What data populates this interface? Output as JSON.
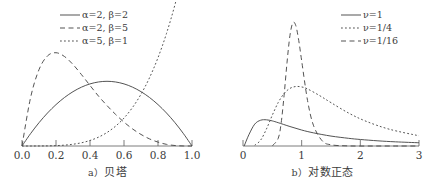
{
  "figure": {
    "background_color": "#ffffff",
    "line_color": "#4a4a4a",
    "axis_color": "#6e6e6e",
    "text_color": "#3c3c3c"
  },
  "panels": [
    {
      "id": "beta",
      "caption_letter": "a）",
      "caption_text": "贝塔",
      "caption_full": "a）贝塔"
    },
    {
      "id": "lognormal",
      "caption_letter": "b）",
      "caption_text": "对数正态",
      "caption_full": "b）对数正态"
    }
  ],
  "chart_data": [
    {
      "type": "line",
      "id": "beta",
      "title": "a）贝塔",
      "xlabel": "",
      "ylabel": "",
      "xlim": [
        0.0,
        1.0
      ],
      "ylim": [
        0.0,
        3.2
      ],
      "grid": false,
      "legend_position": "top-center",
      "xticks": [
        0.0,
        0.2,
        0.4,
        0.6,
        0.8,
        1.0
      ],
      "xticklabels": [
        "0.0",
        "0.2",
        "0.4",
        "0.6",
        "0.8",
        "1.0"
      ],
      "yticks": [],
      "yticklabels": [],
      "series": [
        {
          "name": "α=2, β=2",
          "alpha": 2,
          "beta": 2,
          "linestyle": "solid",
          "x": [
            0.0,
            0.05,
            0.1,
            0.15,
            0.2,
            0.25,
            0.3,
            0.35,
            0.4,
            0.45,
            0.5,
            0.55,
            0.6,
            0.65,
            0.7,
            0.75,
            0.8,
            0.85,
            0.9,
            0.95,
            1.0
          ],
          "values": [
            0.0,
            0.285,
            0.54,
            0.765,
            0.96,
            1.125,
            1.26,
            1.365,
            1.44,
            1.485,
            1.5,
            1.485,
            1.44,
            1.365,
            1.26,
            1.125,
            0.96,
            0.765,
            0.54,
            0.285,
            0.0
          ]
        },
        {
          "name": "α=2, β=5",
          "alpha": 2,
          "beta": 5,
          "linestyle": "dashed",
          "x": [
            0.0,
            0.05,
            0.1,
            0.15,
            0.2,
            0.25,
            0.3,
            0.35,
            0.4,
            0.45,
            0.5,
            0.55,
            0.6,
            0.65,
            0.7,
            0.75,
            0.8,
            0.85,
            0.9,
            0.95,
            1.0
          ],
          "values": [
            0.0,
            1.114,
            1.771,
            2.089,
            2.163,
            2.075,
            1.89,
            1.655,
            1.404,
            1.157,
            0.938,
            0.735,
            0.553,
            0.397,
            0.268,
            0.165,
            0.09,
            0.038,
            0.011,
            0.001,
            0.0
          ]
        },
        {
          "name": "α=5, β=1",
          "alpha": 5,
          "beta": 1,
          "linestyle": "dotted",
          "x": [
            0.0,
            0.05,
            0.1,
            0.15,
            0.2,
            0.25,
            0.3,
            0.35,
            0.4,
            0.45,
            0.5,
            0.55,
            0.6,
            0.65,
            0.7,
            0.75,
            0.8,
            0.85,
            0.9,
            0.95,
            1.0
          ],
          "values": [
            0.0,
            0.0,
            0.001,
            0.003,
            0.008,
            0.02,
            0.041,
            0.075,
            0.128,
            0.205,
            0.313,
            0.458,
            0.648,
            0.893,
            1.201,
            1.582,
            2.048,
            2.61,
            3.281,
            4.073,
            5.0
          ]
        }
      ],
      "legend": [
        {
          "label": "α=2, β=2",
          "linestyle": "solid"
        },
        {
          "label": "α=2, β=5",
          "linestyle": "dashed"
        },
        {
          "label": "α=5, β=1",
          "linestyle": "dotted"
        }
      ]
    },
    {
      "type": "line",
      "id": "lognormal",
      "title": "b）对数正态",
      "xlabel": "",
      "ylabel": "",
      "xlim": [
        0,
        3
      ],
      "ylim": [
        0.0,
        3.4
      ],
      "grid": false,
      "legend_position": "top-right",
      "xticks": [
        0,
        1,
        2,
        3
      ],
      "xticklabels": [
        "0",
        "1",
        "2",
        "3"
      ],
      "yticks": [],
      "yticklabels": [],
      "series": [
        {
          "name": "ν=1",
          "nu": 1,
          "linestyle": "solid",
          "x": [
            0.02,
            0.1,
            0.2,
            0.3,
            0.4,
            0.5,
            0.6,
            0.8,
            1.0,
            1.2,
            1.5,
            1.8,
            2.0,
            2.3,
            2.6,
            3.0
          ],
          "values": [
            0.0,
            0.281,
            0.547,
            0.644,
            0.655,
            0.627,
            0.583,
            0.487,
            0.399,
            0.329,
            0.248,
            0.192,
            0.163,
            0.129,
            0.104,
            0.081
          ]
        },
        {
          "name": "ν=1/4",
          "nu": 0.25,
          "linestyle": "dotted",
          "x": [
            0.2,
            0.3,
            0.4,
            0.5,
            0.6,
            0.7,
            0.8,
            0.9,
            1.0,
            1.1,
            1.3,
            1.5,
            1.8,
            2.1,
            2.5,
            3.0
          ],
          "values": [
            0.02,
            0.145,
            0.426,
            0.772,
            1.086,
            1.311,
            1.44,
            1.487,
            1.476,
            1.427,
            1.265,
            1.084,
            0.824,
            0.617,
            0.417,
            0.255
          ]
        },
        {
          "name": "ν=1/16",
          "nu": 0.0625,
          "linestyle": "dashed",
          "x": [
            0.5,
            0.6,
            0.65,
            0.7,
            0.75,
            0.8,
            0.85,
            0.9,
            0.95,
            1.0,
            1.1,
            1.2,
            1.35,
            1.5,
            1.8,
            2.2,
            2.6,
            3.0
          ],
          "values": [
            0.003,
            0.19,
            0.57,
            1.26,
            2.08,
            2.76,
            3.08,
            3.01,
            2.64,
            2.13,
            1.14,
            0.52,
            0.13,
            0.03,
            0.002,
            0.0,
            0.0,
            0.0
          ]
        }
      ],
      "legend": [
        {
          "label": "ν=1",
          "linestyle": "solid"
        },
        {
          "label": "ν=1/4",
          "linestyle": "dotted"
        },
        {
          "label": "ν=1/16",
          "linestyle": "dashed"
        }
      ]
    }
  ]
}
